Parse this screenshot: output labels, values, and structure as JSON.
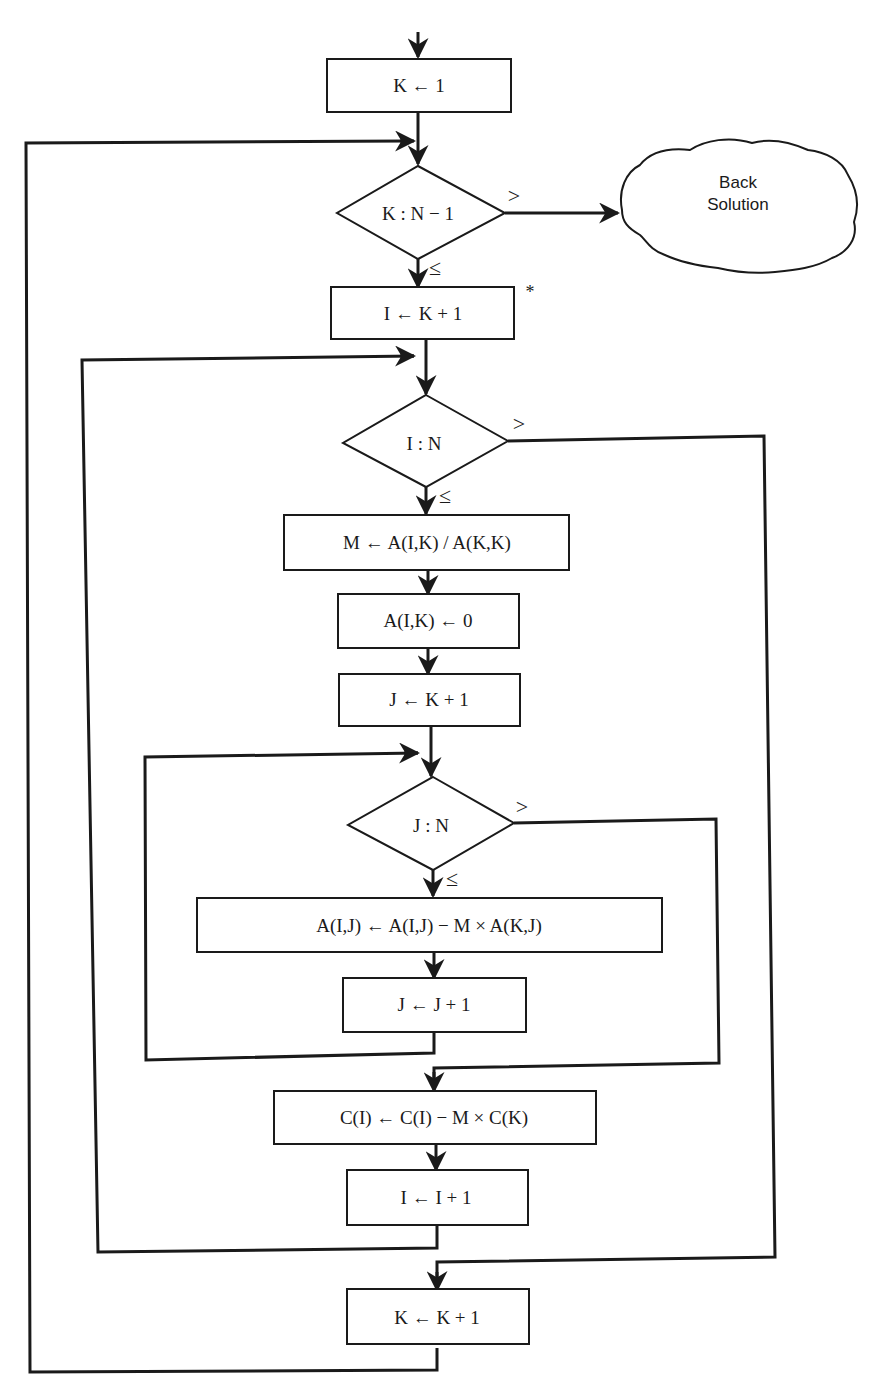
{
  "diagram": {
    "type": "flowchart",
    "nodes": {
      "init_k": {
        "shape": "process",
        "text": "K ← 1"
      },
      "test_k": {
        "shape": "decision",
        "text": "K : N − 1"
      },
      "back_solution": {
        "shape": "cloud",
        "line1": "Back",
        "line2": "Solution"
      },
      "init_i": {
        "shape": "process",
        "text": "I ← K + 1",
        "mark": "*"
      },
      "test_i": {
        "shape": "decision",
        "text": "I : N"
      },
      "compute_m": {
        "shape": "process",
        "text": "M ← A(I,K) / A(K,K)"
      },
      "zero_aik": {
        "shape": "process",
        "text": "A(I,K) ← 0"
      },
      "init_j": {
        "shape": "process",
        "text": "J ← K + 1"
      },
      "test_j": {
        "shape": "decision",
        "text": "J : N"
      },
      "update_aij": {
        "shape": "process",
        "text": "A(I,J) ← A(I,J) − M × A(K,J)"
      },
      "inc_j": {
        "shape": "process",
        "text": "J ← J + 1"
      },
      "update_ci": {
        "shape": "process",
        "text": "C(I) ← C(I) − M × C(K)"
      },
      "inc_i": {
        "shape": "process",
        "text": "I ← I + 1"
      },
      "inc_k": {
        "shape": "process",
        "text": "K ← K + 1"
      }
    },
    "branch_labels": {
      "greater": ">",
      "less_equal": "≤"
    },
    "edges": [
      {
        "from": "start",
        "to": "init_k"
      },
      {
        "from": "init_k",
        "to": "test_k"
      },
      {
        "from": "test_k",
        "to": "back_solution",
        "label": ">"
      },
      {
        "from": "test_k",
        "to": "init_i",
        "label": "≤"
      },
      {
        "from": "init_i",
        "to": "test_i"
      },
      {
        "from": "test_i",
        "to": "inc_k",
        "label": ">"
      },
      {
        "from": "test_i",
        "to": "compute_m",
        "label": "≤"
      },
      {
        "from": "compute_m",
        "to": "zero_aik"
      },
      {
        "from": "zero_aik",
        "to": "init_j"
      },
      {
        "from": "init_j",
        "to": "test_j"
      },
      {
        "from": "test_j",
        "to": "update_ci",
        "label": ">"
      },
      {
        "from": "test_j",
        "to": "update_aij",
        "label": "≤"
      },
      {
        "from": "update_aij",
        "to": "inc_j"
      },
      {
        "from": "inc_j",
        "to": "test_j"
      },
      {
        "from": "update_ci",
        "to": "inc_i"
      },
      {
        "from": "inc_i",
        "to": "test_i"
      },
      {
        "from": "inc_k",
        "to": "test_k"
      }
    ]
  }
}
